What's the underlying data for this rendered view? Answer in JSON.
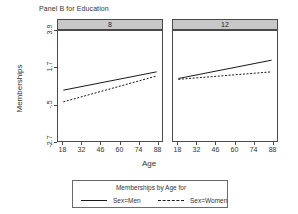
{
  "title": "Panel B for Education",
  "axes": {
    "ylabel": "Memberships",
    "xlabel": "Age",
    "yticks": [
      "3.9",
      "1.7",
      "-.5",
      "-2.7"
    ],
    "xticks": [
      "18",
      "32",
      "46",
      "60",
      "74",
      "88"
    ]
  },
  "panels": [
    {
      "strip": "8"
    },
    {
      "strip": "12"
    }
  ],
  "legend": {
    "title": "Memberships by Age for",
    "entries": [
      {
        "label": "Sex=Men",
        "style": "solid"
      },
      {
        "label": "Sex=Women",
        "style": "dashed"
      }
    ]
  },
  "chart_data": {
    "type": "line",
    "title": "Panel B for Education",
    "xlabel": "Age",
    "ylabel": "Memberships",
    "xlim": [
      14,
      92
    ],
    "ylim": [
      -2.7,
      3.9
    ],
    "yticks": [
      3.9,
      1.7,
      -0.5,
      -2.7
    ],
    "xticks": [
      18,
      32,
      46,
      60,
      74,
      88
    ],
    "grid": false,
    "legend_position": "bottom",
    "legend_title": "Memberships by Age for",
    "panel_variable": "Education",
    "panels": [
      {
        "panel": "8",
        "series": [
          {
            "name": "Sex=Men",
            "style": "solid",
            "x": [
              18,
              88
            ],
            "y": [
              0.35,
              1.45
            ]
          },
          {
            "name": "Sex=Women",
            "style": "dashed",
            "x": [
              18,
              88
            ],
            "y": [
              -0.35,
              1.2
            ]
          }
        ]
      },
      {
        "panel": "12",
        "series": [
          {
            "name": "Sex=Men",
            "style": "solid",
            "x": [
              18,
              88
            ],
            "y": [
              1.05,
              2.15
            ]
          },
          {
            "name": "Sex=Women",
            "style": "dashed",
            "x": [
              18,
              88
            ],
            "y": [
              1.0,
              1.45
            ]
          }
        ]
      }
    ],
    "colors": {
      "line": "#1a1a1a",
      "strip_background": "#c8c8c8",
      "frame": "#4a4a4a"
    }
  }
}
